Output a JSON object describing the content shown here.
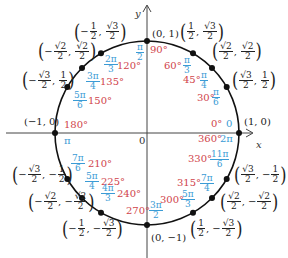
{
  "diagram": {
    "colors": {
      "degree": "#d0434a",
      "radian": "#3a9bd5",
      "axis": "#333333",
      "circle": "#111111"
    },
    "axes": {
      "x_label": "x",
      "y_label": "y",
      "origin_label": "0"
    },
    "points": [
      {
        "angle_deg": "0°",
        "angle_rad": "0",
        "coord": "(1, 0)"
      },
      {
        "angle_deg": "30°",
        "angle_rad": "π/6",
        "coord": "(√3/2, 1/2)"
      },
      {
        "angle_deg": "45°",
        "angle_rad": "π/4",
        "coord": "(√2/2, √2/2)"
      },
      {
        "angle_deg": "60°",
        "angle_rad": "π/3",
        "coord": "(1/2, √3/2)"
      },
      {
        "angle_deg": "90°",
        "angle_rad": "π/2",
        "coord": "(0, 1)"
      },
      {
        "angle_deg": "120°",
        "angle_rad": "2π/3",
        "coord": "(−1/2, √3/2)"
      },
      {
        "angle_deg": "135°",
        "angle_rad": "3π/4",
        "coord": "(−√2/2, √2/2)"
      },
      {
        "angle_deg": "150°",
        "angle_rad": "5π/6",
        "coord": "(−√3/2, 1/2)"
      },
      {
        "angle_deg": "180°",
        "angle_rad": "π",
        "coord": "(−1, 0)"
      },
      {
        "angle_deg": "210°",
        "angle_rad": "7π/6",
        "coord": "(−√3/2, −1/2)"
      },
      {
        "angle_deg": "225°",
        "angle_rad": "5π/4",
        "coord": "(−√2/2, −√2/2)"
      },
      {
        "angle_deg": "240°",
        "angle_rad": "4π/3",
        "coord": "(−1/2, −√3/2)"
      },
      {
        "angle_deg": "270°",
        "angle_rad": "3π/2",
        "coord": "(0, −1)"
      },
      {
        "angle_deg": "300°",
        "angle_rad": "5π/3",
        "coord": "(1/2, −√3/2)"
      },
      {
        "angle_deg": "315°",
        "angle_rad": "7π/4",
        "coord": "(√2/2, −√2/2)"
      },
      {
        "angle_deg": "330°",
        "angle_rad": "11π/6",
        "coord": "(√3/2, −1/2)"
      },
      {
        "angle_deg": "360°",
        "angle_rad": "2π",
        "coord": "(1, 0)"
      }
    ],
    "text": {
      "c_1_0": "(1, 0)",
      "c_0_1": "(0, 1)",
      "c_m1_0": "(−1, 0)",
      "c_0_m1": "(0, −1)",
      "pi": "π",
      "zero": "0",
      "d0": "0°",
      "d30": "30°",
      "d45": "45°",
      "d60": "60°",
      "d90": "90°",
      "d120": "120°",
      "d135": "135°",
      "d150": "150°",
      "d180": "180°",
      "d210": "210°",
      "d225": "225°",
      "d240": "240°",
      "d270": "270°",
      "d300": "300°",
      "d315": "315°",
      "d330": "330°",
      "d360": "360°",
      "r_pi": "π",
      "r_2pi": "2π",
      "r_3pi": "3π",
      "r_4pi": "4π",
      "r_5pi": "5π",
      "r_7pi": "7π",
      "r_11pi": "11π",
      "n1": "1",
      "n2": "2",
      "n3": "3",
      "n4": "4",
      "n6": "6",
      "s2": "√2",
      "s3": "√3",
      "minus": "−",
      "comma": ","
    }
  }
}
